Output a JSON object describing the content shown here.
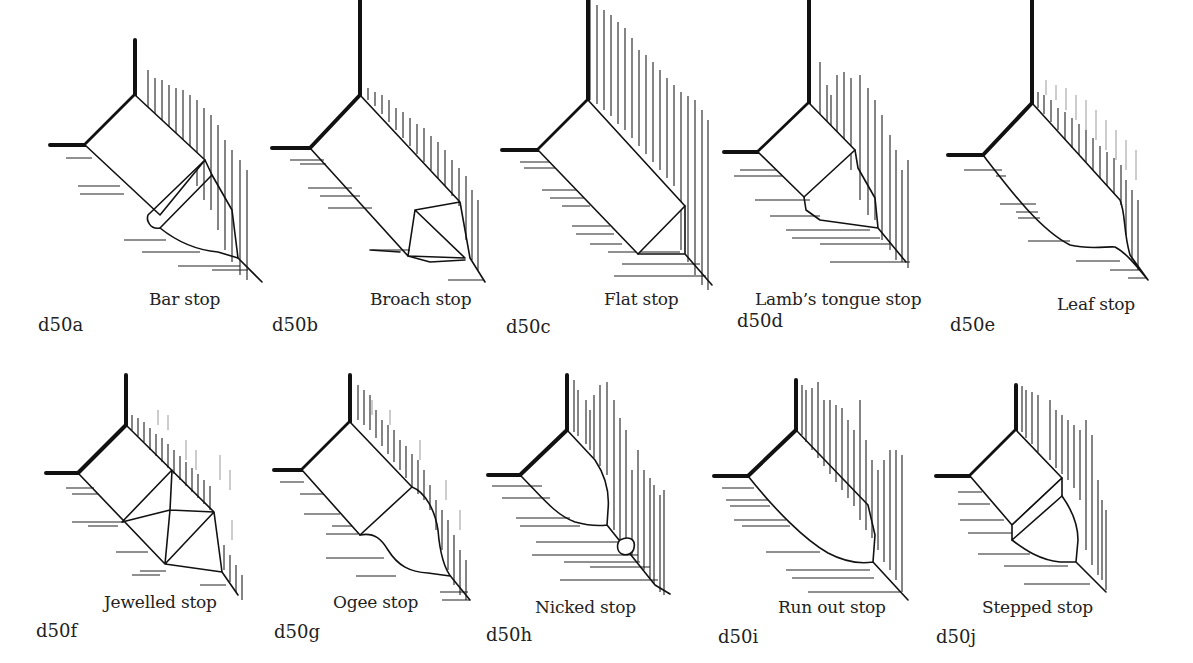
{
  "figure": {
    "panels": [
      {
        "code": "d50a",
        "caption": "Bar stop"
      },
      {
        "code": "d50b",
        "caption": "Broach stop"
      },
      {
        "code": "d50c",
        "caption": "Flat stop"
      },
      {
        "code": "d50d",
        "caption": "Lamb’s tongue stop"
      },
      {
        "code": "d50e",
        "caption": "Leaf stop"
      },
      {
        "code": "d50f",
        "caption": "Jewelled stop"
      },
      {
        "code": "d50g",
        "caption": "Ogee stop"
      },
      {
        "code": "d50h",
        "caption": "Nicked stop"
      },
      {
        "code": "d50i",
        "caption": "Run out stop"
      },
      {
        "code": "d50j",
        "caption": "Stepped stop"
      }
    ]
  }
}
